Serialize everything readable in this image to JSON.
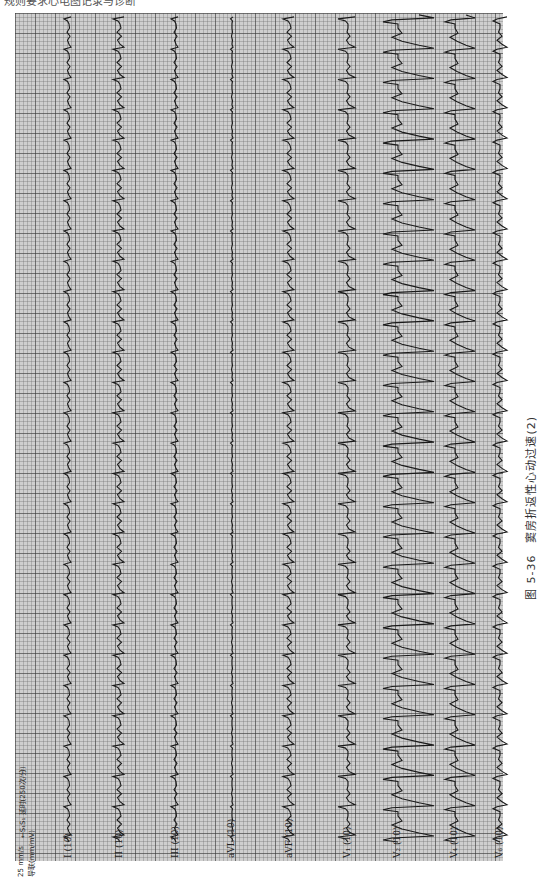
{
  "header_cut_text": "规则要求心电图记录与诊断",
  "sheet": {
    "speed": "25 mm/s",
    "gain": "导联(mm/mV)",
    "annotation": "←S₁S₁ 延时(250次/分)"
  },
  "leads": [
    {
      "name": "I",
      "gain": "(10)",
      "label": "I (10)",
      "x": 69,
      "type": "limb_small"
    },
    {
      "name": "II",
      "gain": "(10)",
      "label": "II (10)",
      "x": 120,
      "type": "limb_med"
    },
    {
      "name": "III",
      "gain": "(10)",
      "label": "III (10)",
      "x": 176,
      "type": "limb_small"
    },
    {
      "name": "aVL",
      "gain": "(10)",
      "label": "aVL (10)",
      "x": 232,
      "type": "avl"
    },
    {
      "name": "aVF",
      "gain": "(10)",
      "label": "aVF (10)",
      "x": 290,
      "type": "limb_med"
    },
    {
      "name": "V1",
      "gain": "(10)",
      "label": "V₁ (10)",
      "x": 348,
      "type": "v1"
    },
    {
      "name": "V2",
      "gain": "(10)",
      "label": "V₂ (10)",
      "x": 398,
      "type": "v2"
    },
    {
      "name": "V4",
      "gain": "(10)",
      "label": "V₄ (10)",
      "x": 455,
      "type": "v4"
    },
    {
      "name": "V6",
      "gain": "(10)",
      "label": "V₆ (10)",
      "x": 500,
      "type": "v6"
    }
  ],
  "rhythm": {
    "beat_spacing_px": 30.3,
    "first_beat_y": 30,
    "beat_count": 28
  },
  "caption": "图 5-36　窦房折返性心动过速(2)"
}
